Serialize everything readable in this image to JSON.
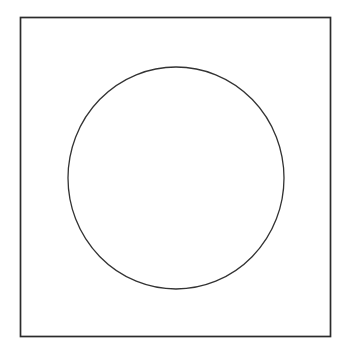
{
  "figure": {
    "background_color": "#ffffff",
    "canvas": {
      "width": 350,
      "height": 358
    },
    "shapes": [
      {
        "name": "outer-square",
        "type": "rectangle",
        "x": 20.5,
        "y": 17.5,
        "width": 310,
        "height": 319,
        "stroke_color": "#2b2b2b",
        "stroke_width": 1.7,
        "fill": "none"
      },
      {
        "name": "inscribed-circle",
        "type": "ellipse",
        "cx": 176,
        "cy": 178,
        "rx": 108,
        "ry": 111,
        "stroke_color": "#333333",
        "stroke_width": 1.3,
        "fill": "none"
      }
    ]
  },
  "chart_data": {
    "type": "table",
    "xlabel": "",
    "ylabel": "",
    "columns": [
      "shape",
      "center_x",
      "center_y",
      "width",
      "height",
      "stroke"
    ],
    "rows": [
      [
        "square",
        "175.5",
        "177",
        "310",
        "319",
        "#2b2b2b"
      ],
      [
        "circle",
        "176",
        "178",
        "216",
        "222",
        "#333333"
      ]
    ],
    "annotations": []
  }
}
